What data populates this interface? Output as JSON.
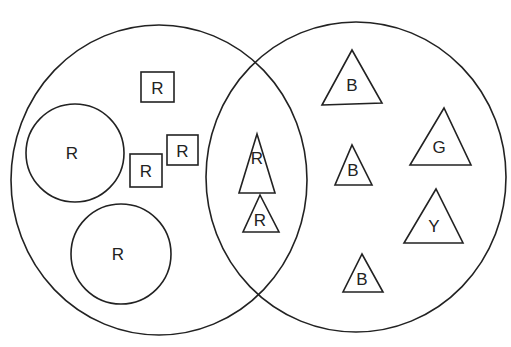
{
  "diagram": {
    "type": "venn",
    "sets": [
      {
        "name": "left-set",
        "cx": 159,
        "cy": 180,
        "rx": 148,
        "ry": 155
      },
      {
        "name": "right-set",
        "cx": 356,
        "cy": 177,
        "rx": 150,
        "ry": 155
      }
    ],
    "circles": [
      {
        "label": "R",
        "cx": 75,
        "cy": 153,
        "r": 49
      },
      {
        "label": "R",
        "cx": 121,
        "cy": 254,
        "r": 50
      }
    ],
    "squares": [
      {
        "label": "R",
        "x": 141,
        "y": 72,
        "w": 33,
        "h": 30
      },
      {
        "label": "R",
        "x": 130,
        "y": 154,
        "w": 32,
        "h": 33
      },
      {
        "label": "R",
        "x": 167,
        "y": 135,
        "w": 31,
        "h": 30
      }
    ],
    "triangles": [
      {
        "label": "R",
        "points": "239,193 275,193 257,134",
        "tx": 257,
        "ty": 158
      },
      {
        "label": "R",
        "points": "243,232 279,232 260,195",
        "tx": 260,
        "ty": 220
      },
      {
        "label": "B",
        "points": "322,105 382,103 352,50",
        "tx": 352,
        "ty": 85
      },
      {
        "label": "B",
        "points": "335,185 372,185 352,145",
        "tx": 353,
        "ty": 170
      },
      {
        "label": "B",
        "points": "343,292 383,292 362,254",
        "tx": 362,
        "ty": 279
      },
      {
        "label": "G",
        "points": "410,165 471,165 444,108",
        "tx": 439,
        "ty": 147
      },
      {
        "label": "Y",
        "points": "404,243 463,243 436,189",
        "tx": 434,
        "ty": 226
      }
    ]
  }
}
